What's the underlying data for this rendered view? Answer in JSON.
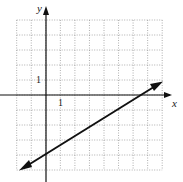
{
  "chart_data": {
    "type": "line",
    "title": "",
    "xlabel": "x",
    "ylabel": "y",
    "xlim": [
      -2,
      8
    ],
    "ylim": [
      -5,
      5
    ],
    "grid": true,
    "tick_labels": {
      "x": [
        "1"
      ],
      "y": [
        "1"
      ]
    },
    "series": [
      {
        "name": "line",
        "points": [
          [
            -1.8,
            -5.0
          ],
          [
            8.0,
            1.0
          ]
        ],
        "y_intercept": -4,
        "x_intercept": 6.6,
        "slope": 0.6,
        "arrows": "both"
      }
    ]
  },
  "labels": {
    "x_axis": "x",
    "y_axis": "y",
    "x_tick": "1",
    "y_tick": "1"
  },
  "colors": {
    "grid": "#9a9a9a",
    "axes": "#111111",
    "line": "#111111"
  }
}
